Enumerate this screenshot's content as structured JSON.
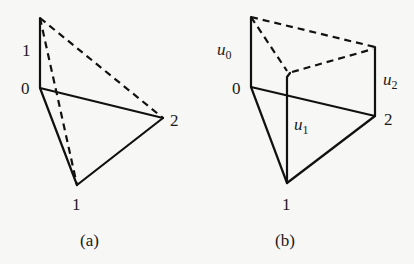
{
  "panels": [
    {
      "id": "a",
      "caption": "(a)",
      "labels": {
        "top_left": "1",
        "vertex0": "0",
        "vertex2": "2",
        "vertex1": "1"
      },
      "points": {
        "apex": [
          40,
          18
        ],
        "v0": [
          40,
          88
        ],
        "v2": [
          163,
          118
        ],
        "v1": [
          77,
          185
        ]
      }
    },
    {
      "id": "b",
      "caption": "(b)",
      "labels": {
        "u0_base": "u",
        "u0_sub": "0",
        "u1_base": "u",
        "u1_sub": "1",
        "u2_base": "u",
        "u2_sub": "2",
        "vertex0": "0",
        "vertex1": "1",
        "vertex2": "2"
      },
      "points": {
        "t0": [
          251,
          17
        ],
        "v0": [
          251,
          87
        ],
        "t1": [
          287,
          73
        ],
        "v1": [
          287,
          183
        ],
        "t2": [
          375,
          47
        ],
        "v2": [
          375,
          116
        ]
      }
    }
  ]
}
